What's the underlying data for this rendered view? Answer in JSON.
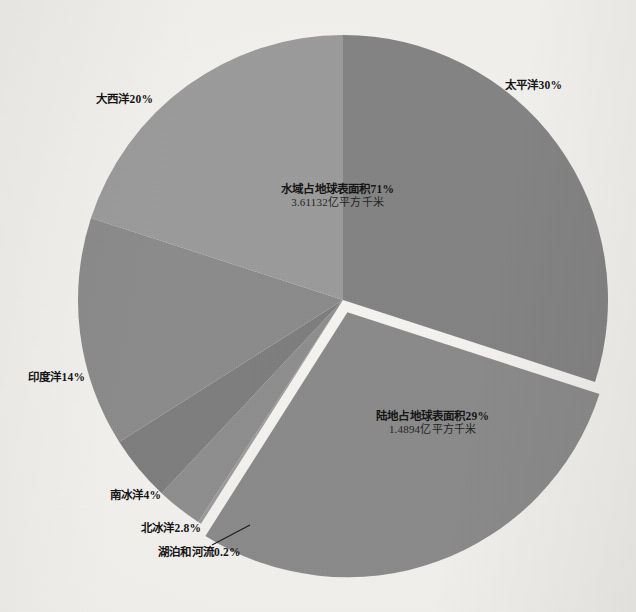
{
  "chart_data": {
    "type": "pie",
    "title": "",
    "subtitle": "",
    "xlabel": "",
    "ylabel": "",
    "legend_position": "none",
    "grid": false,
    "units": "%",
    "center_annotations": [
      {
        "name": "water-annotation",
        "line1": "水域占地球表面积71%",
        "line2": "3.61132亿平方千米"
      },
      {
        "name": "land-annotation",
        "line1": "陆地占地球表面积29%",
        "line2": "1.4894亿平方千米"
      }
    ],
    "categories": [
      "太平洋",
      "陆地",
      "湖泊和河流",
      "北冰洋",
      "南冰洋",
      "印度洋",
      "大西洋"
    ],
    "values": [
      30,
      29,
      0.2,
      2.8,
      4,
      14,
      20
    ],
    "slices": [
      {
        "label": "太平洋30%",
        "name": "太平洋",
        "value": 30,
        "color": "#838383",
        "exploded": false
      },
      {
        "label": "陆地占地球表面积29%",
        "name": "陆地",
        "value": 29,
        "color": "#8a8a8a",
        "exploded": true
      },
      {
        "label": "湖泊和河流0.2%",
        "name": "湖泊和河流",
        "value": 0.2,
        "color": "#9a9a9a",
        "exploded": false
      },
      {
        "label": "北冰洋2.8%",
        "name": "北冰洋",
        "value": 2.8,
        "color": "#8e8e8e",
        "exploded": false
      },
      {
        "label": "南冰洋4%",
        "name": "南冰洋",
        "value": 4,
        "color": "#7e7e7e",
        "exploded": false
      },
      {
        "label": "印度洋14%",
        "name": "印度洋",
        "value": 14,
        "color": "#8b8b8b",
        "exploded": false
      },
      {
        "label": "大西洋20%",
        "name": "大西洋",
        "value": 20,
        "color": "#9b9b9b",
        "exploded": false
      }
    ]
  },
  "labels": {
    "pacific": "太平洋30%",
    "atlantic": "大西洋20%",
    "indian": "印度洋14%",
    "southern": "南冰洋4%",
    "arctic": "北冰洋2.8%",
    "lakes_rivers": "湖泊和河流0.2%",
    "water_main": "水域占地球表面积71%",
    "water_sub": "3.61132亿平方千米",
    "land_main": "陆地占地球表面积29%",
    "land_sub": "1.4894亿平方千米"
  },
  "colors": {
    "pacific": "#838383",
    "atlantic": "#9b9b9b",
    "indian": "#8b8b8b",
    "southern": "#7e7e7e",
    "arctic": "#8e8e8e",
    "lakes_rivers": "#9a9a9a",
    "land": "#8a8a8a",
    "page_background": "#f1f0ec",
    "label_text": "#141414"
  }
}
